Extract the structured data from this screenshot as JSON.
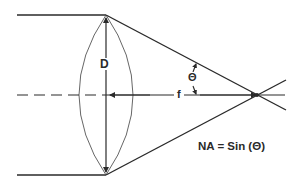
{
  "diagram": {
    "type": "optics-lens-numerical-aperture",
    "labels": {
      "diameter": "D",
      "focal_length": "f",
      "half_angle": "Θ",
      "formula": "NA = Sin (Θ)"
    },
    "colors": {
      "line": "#2a2a2a",
      "background": "#ffffff"
    },
    "elements": [
      "incoming-ray-top",
      "incoming-ray-bottom",
      "biconvex-lens",
      "diameter-arrow",
      "optical-axis-dashed",
      "optical-axis-solid",
      "converging-ray-top",
      "converging-ray-bottom",
      "focal-point",
      "angle-arc"
    ]
  }
}
